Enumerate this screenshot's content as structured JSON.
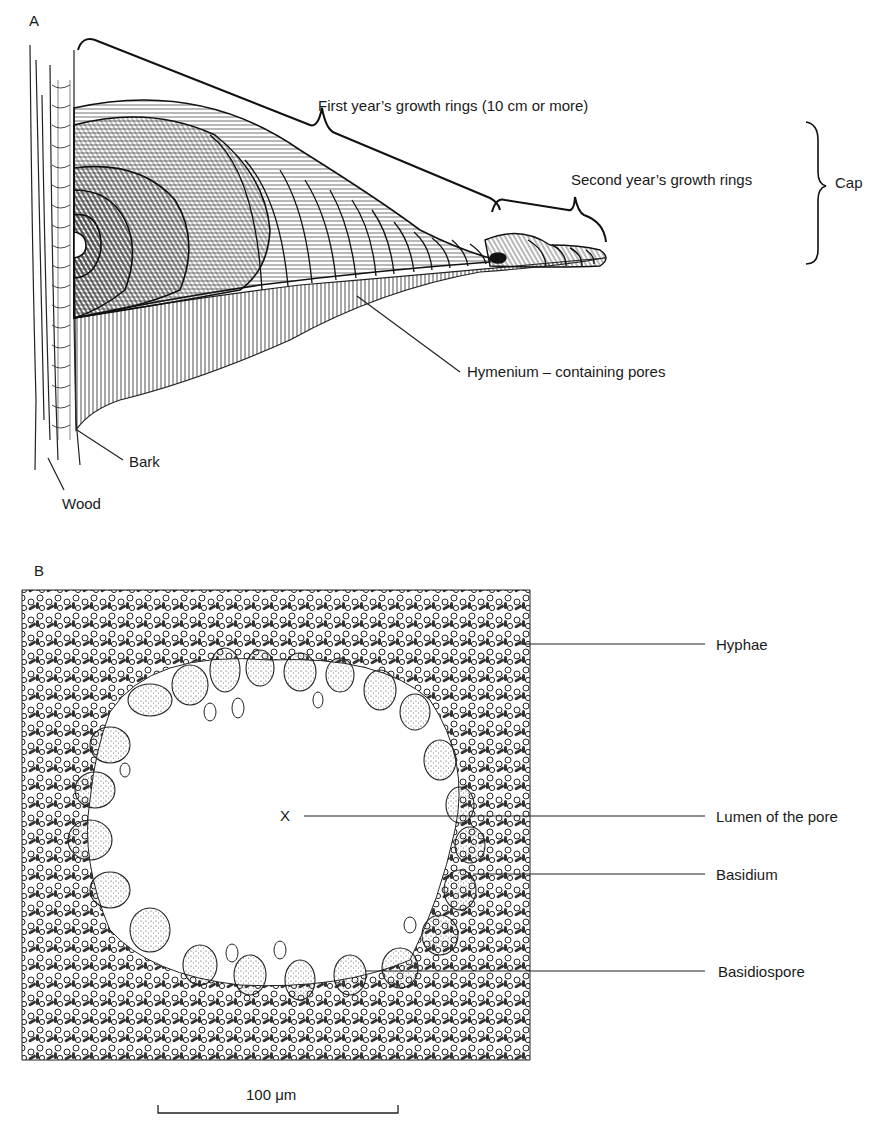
{
  "figure": {
    "panel_a": {
      "letter": "A",
      "labels": {
        "first_year": "First year’s growth rings (10 cm or more)",
        "second_year": "Second year’s growth rings",
        "cap": "Cap",
        "hymenium": "Hymenium  – containing pores",
        "bark": "Bark",
        "wood": "Wood"
      }
    },
    "panel_b": {
      "letter": "B",
      "labels": {
        "hyphae": "Hyphae",
        "lumen_marker": "X",
        "lumen": "Lumen of the pore",
        "basidium": "Basidium",
        "basidiospore": "Basidiospore"
      },
      "scale_bar": {
        "label": "100 μm",
        "value": 100,
        "unit": "μm"
      }
    }
  }
}
